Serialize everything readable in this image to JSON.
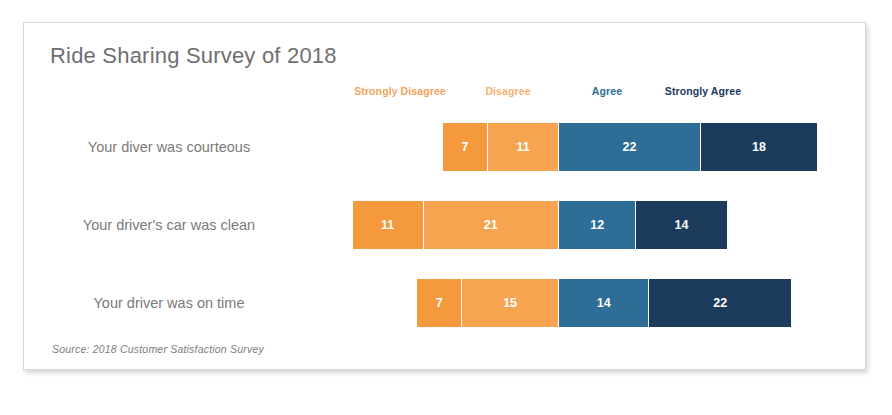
{
  "chart_data": {
    "type": "bar",
    "subtype": "diverging-stacked-bar",
    "title": "Ride Sharing Survey of 2018",
    "source_note": "Source: 2018 Customer Satisfaction Survey",
    "xlabel": "",
    "ylabel": "",
    "grid": false,
    "legend_position": "top",
    "value_labels": true,
    "categories": [
      "Your diver was courteous",
      "Your driver's car was clean",
      "Your driver was on time"
    ],
    "series": [
      {
        "name": "Strongly Disagree",
        "color": "#F59A3C",
        "side": "negative",
        "values": [
          7,
          11,
          7
        ]
      },
      {
        "name": "Disagree",
        "color": "#F7A450",
        "side": "negative",
        "values": [
          11,
          21,
          15
        ]
      },
      {
        "name": "Agree",
        "color": "#2E6E96",
        "side": "positive",
        "values": [
          22,
          12,
          14
        ]
      },
      {
        "name": "Strongly Agree",
        "color": "#1B3A5C",
        "side": "positive",
        "values": [
          18,
          14,
          22
        ]
      }
    ],
    "row_totals": [
      58,
      58,
      58
    ],
    "legend_label_colors": {
      "Strongly Disagree": "#F2A35A",
      "Disagree": "#F6B173",
      "Agree": "#2E6E96",
      "Strongly Agree": "#1B3A5C"
    }
  },
  "legend": [
    {
      "label": "Strongly Disagree",
      "color": "#F2A35A",
      "center_x": 376
    },
    {
      "label": "Disagree",
      "color": "#F6B173",
      "center_x": 484
    },
    {
      "label": "Agree",
      "color": "#2E6E96",
      "center_x": 583
    },
    {
      "label": "Strongly Agree",
      "color": "#1B3A5C",
      "center_x": 679
    }
  ],
  "layout": {
    "center_axis_x": 535,
    "units_per_px": 6.45,
    "row_tops": [
      18,
      96,
      174
    ]
  }
}
